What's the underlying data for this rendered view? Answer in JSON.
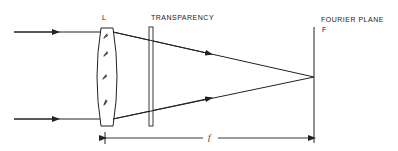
{
  "labels": {
    "lens": "L",
    "transparency": "TRANSPARENCY",
    "fourier_plane": "FOURIER PLANE",
    "fourier_plane_symbol": "F",
    "focal_length": "f"
  },
  "colors": {
    "stroke": "#222222",
    "background": "#ffffff"
  },
  "geometry": {
    "incoming_rays_y": [
      32,
      119
    ],
    "incoming_ray_start_x": 14,
    "lens_x_range": [
      97,
      117
    ],
    "lens_y_range": [
      28,
      126
    ],
    "transparency_x_range": [
      149,
      153
    ],
    "transparency_y_range": [
      27,
      126
    ],
    "fourier_plane_x": 314,
    "fourier_plane_y_range": [
      27,
      143
    ],
    "focal_point": [
      314,
      77
    ],
    "focal_dimension_y": 138,
    "focal_dimension_x_range": [
      105,
      314
    ]
  }
}
